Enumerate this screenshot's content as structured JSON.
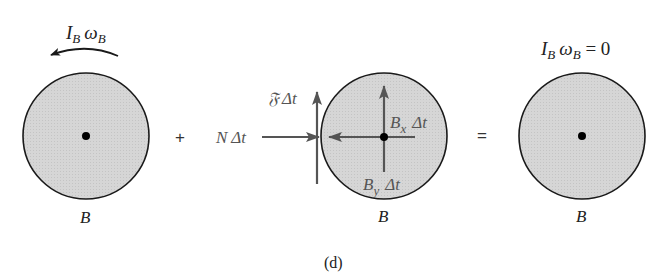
{
  "figure": {
    "caption": "(d)",
    "colors": {
      "disk_fill": "#d4d4d4",
      "disk_stroke": "#1a1a1a",
      "arrow_gray": "#555555",
      "text": "#222222"
    },
    "panels": [
      {
        "id": "initial",
        "body_label": "B",
        "moment_label": {
          "I": "I",
          "I_sub": "B",
          "omega": "ω",
          "omega_sub": "B",
          "suffix": ""
        },
        "arrow": "counterclockwise-curved-arrow"
      },
      {
        "id": "impulses",
        "body_label": "B",
        "impulses": {
          "friction": {
            "sym": "𝔉",
            "delta": "Δt"
          },
          "normal": {
            "sym": "N",
            "delta": "Δt"
          },
          "bx": {
            "sym": "B",
            "sub": "x",
            "delta": "Δt"
          },
          "by": {
            "sym": "B",
            "sub": "y",
            "delta": "Δt"
          }
        }
      },
      {
        "id": "final",
        "body_label": "B",
        "moment_label": {
          "I": "I",
          "I_sub": "B",
          "omega": "ω",
          "omega_sub": "B",
          "suffix": " = 0"
        }
      }
    ],
    "operators": {
      "plus": "+",
      "equals": "="
    }
  }
}
